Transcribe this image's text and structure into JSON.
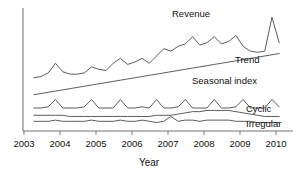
{
  "chart_data": {
    "type": "line",
    "title": "",
    "xlabel": "Year",
    "ylabel": "",
    "grid": false,
    "legend_position": "inline-right",
    "xlim": [
      2003,
      2010.4
    ],
    "ylim": [
      0,
      100
    ],
    "tick_labels": [
      "2003",
      "2004",
      "2005",
      "2006",
      "2007",
      "2008",
      "2009",
      "2010"
    ],
    "x": [
      2003.3,
      2003.5,
      2003.7,
      2003.9,
      2004.1,
      2004.3,
      2004.5,
      2004.7,
      2004.9,
      2005.1,
      2005.3,
      2005.5,
      2005.7,
      2005.9,
      2006.1,
      2006.3,
      2006.5,
      2006.7,
      2006.9,
      2007.1,
      2007.3,
      2007.5,
      2007.7,
      2007.9,
      2008.1,
      2008.3,
      2008.5,
      2008.7,
      2008.9,
      2009.1,
      2009.3,
      2009.5,
      2009.7,
      2009.9,
      2010.1
    ],
    "series": [
      {
        "name": "Revenue",
        "label": "Revenue",
        "values": [
          44,
          45,
          48,
          56,
          49,
          47,
          47,
          48,
          53,
          51,
          50,
          56,
          60,
          55,
          57,
          60,
          56,
          62,
          68,
          66,
          70,
          72,
          78,
          71,
          73,
          78,
          72,
          74,
          79,
          70,
          66,
          65,
          66,
          94,
          73
        ]
      },
      {
        "name": "Trend",
        "label": "Trend",
        "values": [
          30,
          31,
          32,
          33,
          34,
          35,
          36,
          37,
          38,
          39,
          40,
          41,
          42,
          43,
          44,
          45,
          46,
          47,
          48,
          49,
          50,
          51,
          52,
          53,
          54,
          55,
          56,
          57,
          58,
          59,
          60,
          61,
          62,
          63,
          64
        ]
      },
      {
        "name": "Seasonal index",
        "label": "Seasonal index",
        "values": [
          19,
          19,
          20,
          26,
          19,
          19,
          19,
          20,
          26,
          19,
          19,
          19,
          26,
          19,
          19,
          20,
          19,
          26,
          19,
          19,
          20,
          26,
          19,
          19,
          19,
          26,
          19,
          19,
          20,
          26,
          19,
          19,
          19,
          26,
          20
        ]
      },
      {
        "name": "Cyclic",
        "label": "Cyclic",
        "values": [
          13,
          13,
          13,
          13,
          13,
          12,
          12,
          12,
          12,
          12,
          12,
          12,
          12,
          12,
          12,
          12,
          12,
          13,
          13,
          13,
          14,
          15,
          16,
          16,
          17,
          17,
          17,
          17,
          16,
          15,
          14,
          13,
          12,
          12,
          12
        ]
      },
      {
        "name": "Irregular",
        "label": "Irregular",
        "values": [
          8,
          8,
          8,
          9,
          8,
          8,
          8,
          8,
          9,
          8,
          8,
          8,
          9,
          8,
          8,
          9,
          8,
          7,
          8,
          12,
          8,
          9,
          9,
          8,
          9,
          9,
          9,
          9,
          8,
          8,
          8,
          7,
          7,
          7,
          7
        ]
      }
    ],
    "annotations": [
      {
        "text": "Revenue",
        "x": 172,
        "y": 17
      },
      {
        "text": "Trend",
        "x": 235,
        "y": 63
      },
      {
        "text": "Seasonal index",
        "x": 192,
        "y": 84
      },
      {
        "text": "Cyclic",
        "x": 246,
        "y": 112
      },
      {
        "text": "Irregular",
        "x": 246,
        "y": 127
      }
    ]
  },
  "axis": {
    "x_title": "Year",
    "ticks": [
      {
        "label": "2003",
        "x": 24
      },
      {
        "label": "2004",
        "x": 60
      },
      {
        "label": "2005",
        "x": 96
      },
      {
        "label": "2006",
        "x": 132
      },
      {
        "label": "2007",
        "x": 168
      },
      {
        "label": "2008",
        "x": 204
      },
      {
        "label": "2009",
        "x": 240
      },
      {
        "label": "2010",
        "x": 276
      }
    ]
  },
  "style": {
    "background": "#ffffff",
    "line_color": "#4a4a4a",
    "axis_color": "#707070",
    "text_color": "#111111"
  }
}
